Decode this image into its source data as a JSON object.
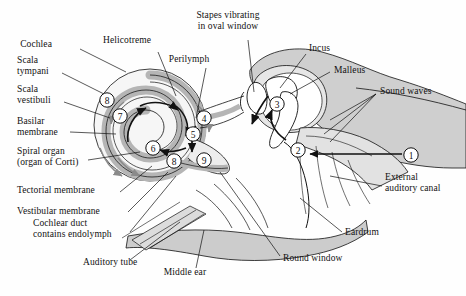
{
  "figure": {
    "background_color": "#fefefe",
    "ink_color": "#111111",
    "fill_light": "#e8e8e8",
    "fill_mid": "#c9c9c9",
    "fill_dark": "#a8a8a8"
  },
  "labels": {
    "cochlea": "Cochlea",
    "helicotreme": "Helicotreme",
    "perilymph": "Perilymph",
    "stapes_oval_window": "Stapes vibrating\nin oval window",
    "incus": "Incus",
    "malleus": "Malleus",
    "sound_waves": "Sound waves",
    "scala_tympani": "Scala\ntympani",
    "scala_vestibuli": "Scala\nvestibuli",
    "basilar_membrane": "Basilar\nmembrane",
    "spiral_organ": "Spiral organ\n(organ of Corti)",
    "tectorial_membrane": "Tectorial membrane",
    "vestibular_membrane": "Vestibular membrane",
    "cochlear_duct": "Cochlear duct\ncontains endolymph",
    "auditory_tube": "Auditory tube",
    "middle_ear": "Middle ear",
    "round_window": "Round window",
    "eardrum": "Eardrum",
    "external_auditory_canal": "External\nauditory canal"
  },
  "step_markers": [
    {
      "id": "marker-1",
      "number": "1",
      "x": 411,
      "y": 155
    },
    {
      "id": "marker-2",
      "number": "2",
      "x": 298,
      "y": 150
    },
    {
      "id": "marker-3",
      "number": "3",
      "x": 277,
      "y": 104
    },
    {
      "id": "marker-4",
      "number": "4",
      "x": 204,
      "y": 118
    },
    {
      "id": "marker-5",
      "number": "5",
      "x": 193,
      "y": 134
    },
    {
      "id": "marker-6",
      "number": "6",
      "x": 153,
      "y": 148
    },
    {
      "id": "marker-7",
      "number": "7",
      "x": 120,
      "y": 116
    },
    {
      "id": "marker-8a",
      "number": "8",
      "x": 107,
      "y": 100
    },
    {
      "id": "marker-8b",
      "number": "8",
      "x": 174,
      "y": 161
    },
    {
      "id": "marker-9",
      "number": "9",
      "x": 204,
      "y": 160
    }
  ],
  "label_positions": {
    "cochlea": {
      "x": 52,
      "y": 44
    },
    "helicotreme": {
      "x": 127,
      "y": 40
    },
    "perilymph": {
      "x": 189,
      "y": 59
    },
    "stapes_oval_window": {
      "x": 228,
      "y": 21
    },
    "incus": {
      "x": 309,
      "y": 48
    },
    "malleus": {
      "x": 334,
      "y": 70
    },
    "sound_waves": {
      "x": 380,
      "y": 91
    },
    "scala_tympani": {
      "x": 17,
      "y": 66
    },
    "scala_vestibuli": {
      "x": 17,
      "y": 95
    },
    "basilar_membrane": {
      "x": 17,
      "y": 127
    },
    "spiral_organ": {
      "x": 17,
      "y": 157
    },
    "tectorial_membrane": {
      "x": 17,
      "y": 190
    },
    "vestibular_membrane": {
      "x": 17,
      "y": 211
    },
    "cochlear_duct": {
      "x": 33,
      "y": 229
    },
    "auditory_tube": {
      "x": 83,
      "y": 262
    },
    "middle_ear": {
      "x": 185,
      "y": 272
    },
    "round_window": {
      "x": 283,
      "y": 258
    },
    "eardrum": {
      "x": 345,
      "y": 232
    },
    "external_auditory_canal": {
      "x": 385,
      "y": 183
    }
  }
}
